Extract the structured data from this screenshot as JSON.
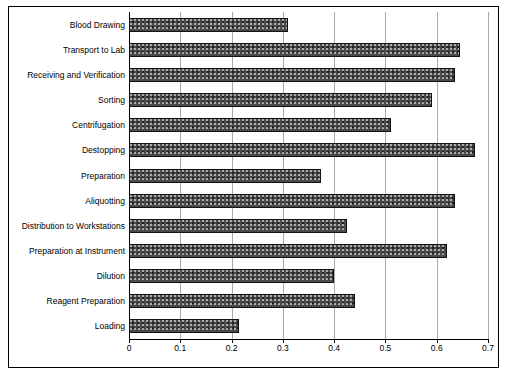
{
  "chart_data": {
    "type": "bar",
    "orientation": "horizontal",
    "title": "",
    "subtitle": "",
    "xlabel": "",
    "ylabel": "",
    "categories": [
      "Blood Drawing",
      "Transport to Lab",
      "Receiving and Verification",
      "Sorting",
      "Centrifugation",
      "Destopping",
      "Preparation",
      "Aliquotting",
      "Distribution to Workstations",
      "Preparation at Instrument",
      "Dilution",
      "Reagent Preparation",
      "Loading"
    ],
    "values": [
      0.31,
      0.645,
      0.635,
      0.59,
      0.51,
      0.675,
      0.375,
      0.635,
      0.425,
      0.62,
      0.4,
      0.44,
      0.215
    ],
    "xticks": [
      "0",
      "0.1",
      "0.2",
      "0.3",
      "0.4",
      "0.5",
      "0.6",
      "0.7"
    ],
    "xtick_values": [
      0,
      0.1,
      0.2,
      0.3,
      0.4,
      0.5,
      0.6,
      0.7
    ],
    "xlim": [
      0,
      0.7
    ],
    "grid": "vertical",
    "legend": "none",
    "bar_color": "#4a4a4a",
    "bar_pattern": "speckled-dark-gray",
    "frame_color": "#000000",
    "grid_color": "#aaaaaa"
  }
}
